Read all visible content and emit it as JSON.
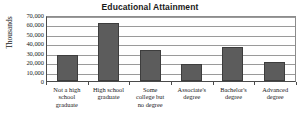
{
  "chart_data": {
    "type": "bar",
    "title": "Educational Attainment",
    "xlabel": "",
    "ylabel": "Thousands",
    "ylim": [
      0,
      70000
    ],
    "grid": true,
    "legend": "none",
    "categories": [
      "Not a high school graduate",
      "High school graduate",
      "Some college but no degree",
      "Associate's degree",
      "Bachelor's degree",
      "Advanced degree"
    ],
    "category_lines": [
      [
        "Not a high",
        "school",
        "graduate"
      ],
      [
        "High school",
        "graduate"
      ],
      [
        "Some",
        "college but",
        "no degree"
      ],
      [
        "Associate's",
        "degree"
      ],
      [
        "Bachelor's",
        "degree"
      ],
      [
        "Advanced",
        "degree"
      ]
    ],
    "values": [
      28000,
      61500,
      33000,
      18000,
      36000,
      20000
    ],
    "ytick_values": [
      70000,
      60000,
      50000,
      40000,
      30000,
      20000,
      10000,
      0
    ],
    "ytick_labels": [
      "70,000",
      "60,000",
      "50,000",
      "40,000",
      "30,000",
      "20,000",
      "10,000",
      "0"
    ],
    "bar_color": "#5c5c5c",
    "bar_border_color": "#3d3d3d",
    "gridline_color": "#9a9a9a",
    "axis_color": "#4a4a4a",
    "background_color": "#ffffff",
    "text_color": "#1a1a1a"
  }
}
